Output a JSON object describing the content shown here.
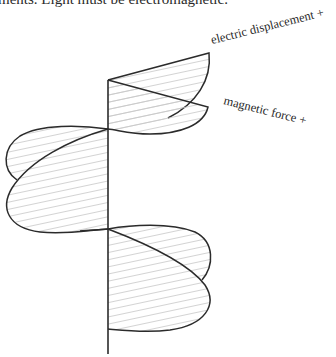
{
  "page": {
    "top_text": "ments. Light must be electromagnetic."
  },
  "figure": {
    "type": "electromagnetic wave diagram",
    "labels": {
      "electric": "electric displacement +",
      "magnetic": "magnetic force +"
    },
    "colors": {
      "stroke": "#2b2b2b",
      "hatch": "#c4c4c4",
      "background": "#ffffff"
    }
  }
}
